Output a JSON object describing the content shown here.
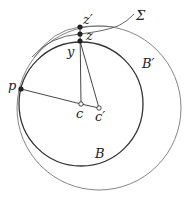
{
  "diagram": {
    "labels": {
      "z_prime": "z′",
      "z": "z",
      "y": "y",
      "sigma": "Σ",
      "b_prime": "B′",
      "p": "p",
      "c": "c",
      "c_prime": "c′",
      "b": "B"
    },
    "circles": [
      {
        "name": "B",
        "cx": 81,
        "cy": 104,
        "r": 62
      },
      {
        "name": "B′",
        "cx": 99,
        "cy": 108,
        "r": 82
      }
    ],
    "points": {
      "z_prime": [
        80,
        27
      ],
      "z": [
        80,
        34
      ],
      "y": [
        80,
        41
      ],
      "p": [
        21,
        89
      ],
      "c": [
        81,
        104
      ],
      "c_prime": [
        99,
        108
      ]
    },
    "colors": {
      "stroke": "#333333",
      "light_stroke": "#777777"
    }
  }
}
